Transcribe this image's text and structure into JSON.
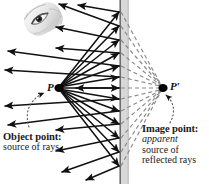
{
  "figure": {
    "background_color": "#ffffff"
  },
  "mirror": {
    "name": "plane-mirror",
    "x_left": 119.5,
    "x_right": 128.5,
    "top": 0,
    "bottom": 184,
    "face_line_color": "#555555",
    "fill_color": "#d8d8d8",
    "edge_color": "#b4b4b4"
  },
  "points": {
    "object": {
      "label": "P",
      "x": 58,
      "y": 88,
      "dot_color": "#000000"
    },
    "image": {
      "label": "P′",
      "x": 163,
      "y": 88,
      "dot_color": "#000000"
    }
  },
  "labels": {
    "object": {
      "heading": "Object point:",
      "line1": "source of rays",
      "heading_color": "#111111",
      "body_color": "#333333"
    },
    "image": {
      "heading": "Image point:",
      "line1": "apparent",
      "line2": "source of",
      "line3": "reflected rays",
      "heading_color": "#111111",
      "body_color": "#333333"
    }
  },
  "rays": {
    "incident_color": "#111111",
    "reflected_color": "#111111",
    "virtual_color": "#8a8a8a",
    "virtual_dash": "4,3",
    "count": 11,
    "incident_endpoints_y": [
      12,
      26,
      40,
      52,
      64,
      76,
      88,
      100,
      112,
      124,
      138,
      152,
      166
    ],
    "description": "Solid rays leave object point P, strike the mirror, and reflect back to the left; dashed gray extensions behind the mirror converge at image point P prime."
  },
  "eye_photo": {
    "name": "observer-eye-photograph",
    "alt": "grayscale photograph of an eye viewing the mirror",
    "x": 22,
    "y": 1,
    "width": 42,
    "height": 37
  },
  "pointers": {
    "object_pointer": {
      "name": "dotted-curve-to-object-point",
      "style": "dotted-curved-arrow"
    },
    "image_pointer": {
      "name": "dotted-curve-to-image-point",
      "style": "dotted-curved-arrow"
    }
  }
}
